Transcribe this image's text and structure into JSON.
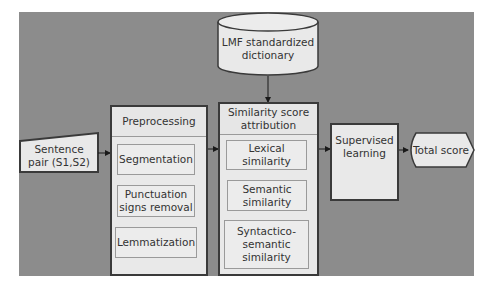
{
  "diagram": {
    "input": {
      "label": "Sentence pair (S1,S2)",
      "lines": [
        "Sentence",
        "pair (S1,S2)"
      ]
    },
    "dictionary": {
      "label": "LMF standardized dictionary",
      "lines": [
        "LMF standardized",
        "dictionary"
      ]
    },
    "preprocessing": {
      "title": "Preprocessing",
      "steps": [
        {
          "label": "Segmentation"
        },
        {
          "label": "Punctuation signs removal",
          "lines": [
            "Punctuation",
            "signs removal"
          ]
        },
        {
          "label": "Lemmatization"
        }
      ]
    },
    "similarity": {
      "title": "Similarity score attribution",
      "title_lines": [
        "Similarity score",
        "attribution"
      ],
      "steps": [
        {
          "label": "Lexical similarity",
          "lines": [
            "Lexical",
            "similarity"
          ]
        },
        {
          "label": "Semantic similarity",
          "lines": [
            "Semantic",
            "similarity"
          ]
        },
        {
          "label": "Syntactico-semantic similarity",
          "lines": [
            "Syntactico-",
            "semantic",
            "similarity"
          ]
        }
      ]
    },
    "learning": {
      "label": "Supervised learning",
      "lines": [
        "Supervised",
        "learning"
      ]
    },
    "output": {
      "label": "Total score"
    },
    "edges": [
      {
        "from": "Sentence pair (S1,S2)",
        "to": "Preprocessing"
      },
      {
        "from": "Preprocessing",
        "to": "Similarity score attribution"
      },
      {
        "from": "LMF standardized dictionary",
        "to": "Similarity score attribution"
      },
      {
        "from": "Similarity score attribution",
        "to": "Supervised learning"
      },
      {
        "from": "Supervised learning",
        "to": "Total score"
      }
    ]
  }
}
